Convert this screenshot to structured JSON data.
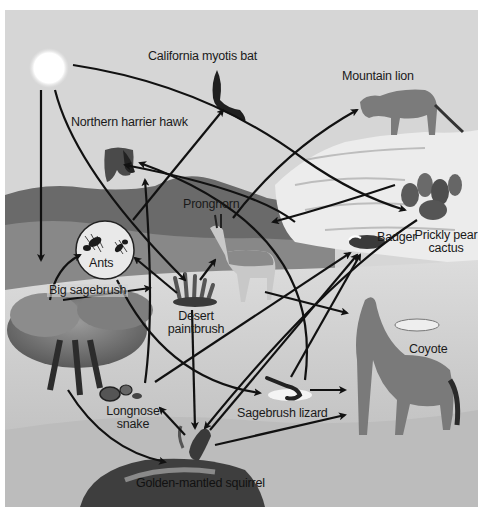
{
  "diagram": {
    "type": "food-web",
    "colors": {
      "sky": "#d6d6d6",
      "mountains": "#6e6e6e",
      "rock": "#e8e8e8",
      "ground": "#cfcfcf",
      "arrow": "#111111",
      "sun": "#ffffff"
    },
    "organisms": [
      {
        "id": "sun",
        "label": ""
      },
      {
        "id": "bat",
        "label": "California myotis bat"
      },
      {
        "id": "lion",
        "label": "Mountain lion"
      },
      {
        "id": "hawk",
        "label": "Northern harrier hawk"
      },
      {
        "id": "pronghorn",
        "label": "Pronghorn"
      },
      {
        "id": "badger",
        "label": "Badger"
      },
      {
        "id": "cactus",
        "label_line1": "Prickly pear",
        "label_line2": "cactus"
      },
      {
        "id": "ants",
        "label": "Ants"
      },
      {
        "id": "sagebrush",
        "label": "Big sagebrush"
      },
      {
        "id": "paintbrush",
        "label_line1": "Desert",
        "label_line2": "paintbrush"
      },
      {
        "id": "coyote",
        "label": "Coyote"
      },
      {
        "id": "snake",
        "label_line1": "Longnose",
        "label_line2": "snake"
      },
      {
        "id": "lizard",
        "label": "Sagebrush lizard"
      },
      {
        "id": "squirrel",
        "label": "Golden-mantled squirrel"
      }
    ],
    "energy_flows": [
      {
        "from": "Sun",
        "to": "Big sagebrush"
      },
      {
        "from": "Sun",
        "to": "Desert paintbrush"
      },
      {
        "from": "Sun",
        "to": "Prickly pear cactus"
      },
      {
        "from": "Big sagebrush",
        "to": "Ants"
      },
      {
        "from": "Big sagebrush",
        "to": "Golden-mantled squirrel"
      },
      {
        "from": "Big sagebrush",
        "to": "Sagebrush lizard"
      },
      {
        "from": "Desert paintbrush",
        "to": "Ants"
      },
      {
        "from": "Desert paintbrush",
        "to": "Pronghorn"
      },
      {
        "from": "Desert paintbrush",
        "to": "Golden-mantled squirrel"
      },
      {
        "from": "Prickly pear cactus",
        "to": "Pronghorn"
      },
      {
        "from": "Prickly pear cactus",
        "to": "Golden-mantled squirrel"
      },
      {
        "from": "Ants",
        "to": "California myotis bat"
      },
      {
        "from": "Ants",
        "to": "Sagebrush lizard"
      },
      {
        "from": "Pronghorn",
        "to": "Mountain lion"
      },
      {
        "from": "Pronghorn",
        "to": "Coyote"
      },
      {
        "from": "Sagebrush lizard",
        "to": "Northern harrier hawk"
      },
      {
        "from": "Sagebrush lizard",
        "to": "Badger"
      },
      {
        "from": "Sagebrush lizard",
        "to": "Coyote"
      },
      {
        "from": "Longnose snake",
        "to": "Northern harrier hawk"
      },
      {
        "from": "Longnose snake",
        "to": "Badger"
      },
      {
        "from": "Golden-mantled squirrel",
        "to": "Longnose snake"
      },
      {
        "from": "Golden-mantled squirrel",
        "to": "Badger"
      },
      {
        "from": "Golden-mantled squirrel",
        "to": "Coyote"
      },
      {
        "from": "Badger",
        "to": "Northern harrier hawk"
      }
    ]
  }
}
